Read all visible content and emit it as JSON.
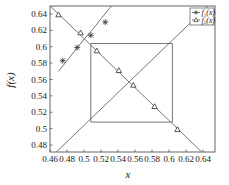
{
  "chart_data": {
    "type": "line",
    "title": "",
    "xlabel": "x",
    "ylabel": "f(x)",
    "xlim": [
      0.46,
      0.65
    ],
    "ylim": [
      0.47,
      0.65
    ],
    "xticks": [
      "0.46",
      "0.48",
      "0.5",
      "0.52",
      "0.54",
      "0.56",
      "0.58",
      "0.6",
      "0.62",
      "0.64"
    ],
    "yticks": [
      "0.48",
      "0.5",
      "0.52",
      "0.54",
      "0.56",
      "0.58",
      "0.6",
      "0.62",
      "0.64"
    ],
    "grid": false,
    "legend_position": "upper right",
    "series": [
      {
        "name": "f1(x)",
        "label": "f₁(x)",
        "marker": "asterisk",
        "line": "solid",
        "x": [
          0.47,
          0.48,
          0.49,
          0.5,
          0.51,
          0.52,
          0.53,
          0.535
        ],
        "y": [
          0.57,
          0.583,
          0.596,
          0.609,
          0.621,
          0.634,
          0.647,
          0.653
        ],
        "markers_at": {
          "x": [
            0.475,
            0.492,
            0.508,
            0.525
          ],
          "y": [
            0.583,
            0.599,
            0.614,
            0.63
          ]
        }
      },
      {
        "name": "f2(x)",
        "label": "f₂(x)",
        "marker": "triangle",
        "line": "solid",
        "x": [
          0.46,
          0.64
        ],
        "y": [
          0.65,
          0.47
        ],
        "markers_at": {
          "x": [
            0.47,
            0.496,
            0.515,
            0.541,
            0.558,
            0.583,
            0.61
          ],
          "y": [
            0.639,
            0.617,
            0.595,
            0.571,
            0.553,
            0.527,
            0.499
          ]
        }
      },
      {
        "name": "identity diagonal",
        "label": "",
        "marker": "none",
        "line": "solid",
        "x": [
          0.466,
          0.65
        ],
        "y": [
          0.47,
          0.654
        ]
      },
      {
        "name": "cycle box",
        "label": "",
        "marker": "none",
        "line": "solid",
        "x": [
          0.508,
          0.604,
          0.604,
          0.508,
          0.508
        ],
        "y": [
          0.604,
          0.604,
          0.508,
          0.508,
          0.604
        ]
      }
    ]
  },
  "legend": {
    "items": [
      {
        "prefix": "f",
        "sub": "1",
        "suffix": "(x)"
      },
      {
        "prefix": "f",
        "sub": "2",
        "suffix": "(x)"
      }
    ]
  },
  "axes": {
    "xlabel": "x",
    "ylabel": "f(x)"
  }
}
